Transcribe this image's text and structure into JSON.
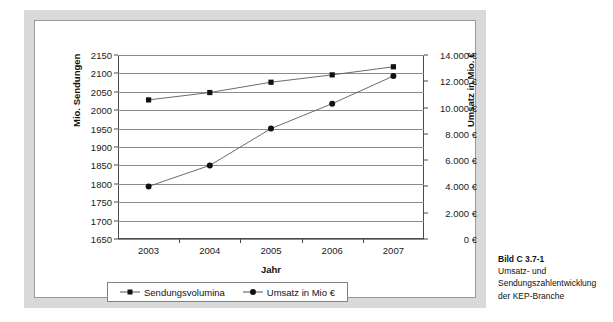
{
  "figure": {
    "caption_title": "Bild C 3.7-1",
    "caption_body": "Umsatz- und Sendungszahlentwicklung der KEP-Branche"
  },
  "chart_data": {
    "type": "line",
    "title": "",
    "subtitle": "",
    "xlabel": "Jahr",
    "ylabel": "Mio. Sendungen",
    "y2label": "Umsatz in Mio. €",
    "categories": [
      "2003",
      "2004",
      "2005",
      "2006",
      "2007"
    ],
    "x_tick_labels": [
      "2003",
      "2004",
      "2005",
      "2006",
      "2007"
    ],
    "ylim": [
      1650,
      2150
    ],
    "y_tick_labels": [
      "2150",
      "2100",
      "2050",
      "2000",
      "1950",
      "1900",
      "1850",
      "1800",
      "1750",
      "1700",
      "1650"
    ],
    "y_ticks": [
      2150,
      2100,
      2050,
      2000,
      1950,
      1900,
      1850,
      1800,
      1750,
      1700,
      1650
    ],
    "y2lim": [
      0,
      14000
    ],
    "y2_tick_labels": [
      "14.000 €",
      "12.000 €",
      "10.000 €",
      "8.000 €",
      "6.000 €",
      "4.000 €",
      "2.000 €",
      "0 €"
    ],
    "y2_ticks": [
      14000,
      12000,
      10000,
      8000,
      6000,
      4000,
      2000,
      0
    ],
    "grid": true,
    "legend_position": "bottom",
    "series": [
      {
        "name": "Sendungsvolumina",
        "axis": "left",
        "marker": "square",
        "color": "#111111",
        "values": [
          2028,
          2048,
          2076,
          2096,
          2118
        ]
      },
      {
        "name": "Umsatz in Mio €",
        "axis": "right",
        "marker": "circle",
        "color": "#111111",
        "values": [
          4000,
          5600,
          8400,
          10300,
          12400
        ]
      }
    ],
    "legend": [
      "Sendungsvolumina",
      "Umsatz in Mio €"
    ]
  }
}
